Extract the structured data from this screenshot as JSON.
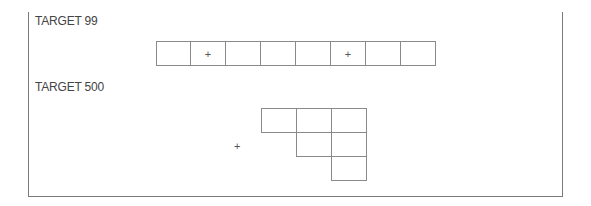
{
  "puzzles": [
    {
      "title": "TARGET 99",
      "cells": [
        "",
        "+",
        "",
        "",
        "",
        "+",
        "",
        ""
      ]
    },
    {
      "title": "TARGET 500",
      "marker": "+",
      "grid": [
        [
          "",
          "",
          ""
        ],
        [
          null,
          "",
          ""
        ],
        [
          null,
          null,
          ""
        ]
      ]
    }
  ]
}
